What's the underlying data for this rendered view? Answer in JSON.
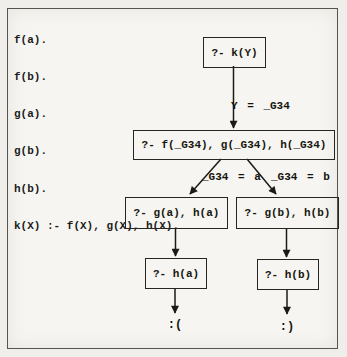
{
  "program": {
    "lines": [
      "f(a).",
      "f(b).",
      "g(a).",
      "g(b).",
      "h(b).",
      "k(X) :- f(X), g(X), h(X)."
    ]
  },
  "tree": {
    "nodes": {
      "root": "?- k(Y)",
      "goal": "?- f(_G34), g(_G34), h(_G34)",
      "left_branch": "?- g(a), h(a)",
      "right_branch": "?- g(b), h(b)",
      "left_leaf": "?- h(a)",
      "right_leaf": "?- h(b)"
    },
    "edges": {
      "root_binding": "Y = _G34",
      "left_binding": "_G34 = a",
      "right_binding": "_G34 = b"
    },
    "outcomes": {
      "fail": ":(",
      "success": ":)"
    }
  },
  "colors": {
    "ink": "#1b1a14",
    "paper": "#f6f5f1",
    "frame_border": "#57544e"
  }
}
